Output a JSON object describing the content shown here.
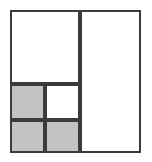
{
  "figure": {
    "name": "rectangle-subdivision-diagram",
    "type": "geometric-dissection",
    "background_color": "#ffffff",
    "stroke_color": "#3b3b3b",
    "stroke_width_px": 2,
    "shaded_fill_color": "#c3c3c3",
    "unshaded_fill_color": "#ffffff",
    "outer_bounds": {
      "x": 10,
      "y": 10,
      "width": 131,
      "height": 143
    },
    "cell_count": 6,
    "shaded_count": 3,
    "unshaded_count": 3,
    "cells": [
      {
        "id": "cell-top-left",
        "label": "top-left-large-white",
        "x": 10,
        "y": 10,
        "width": 70,
        "height": 74,
        "fill": "#ffffff",
        "shaded": false
      },
      {
        "id": "cell-right-tall",
        "label": "right-tall-white",
        "x": 80,
        "y": 10,
        "width": 61,
        "height": 143,
        "fill": "#ffffff",
        "shaded": false
      },
      {
        "id": "cell-mid-left",
        "label": "middle-left-gray",
        "x": 10,
        "y": 84,
        "width": 35,
        "height": 36,
        "fill": "#c3c3c3",
        "shaded": true
      },
      {
        "id": "cell-mid-right",
        "label": "middle-right-white",
        "x": 45,
        "y": 84,
        "width": 35,
        "height": 36,
        "fill": "#ffffff",
        "shaded": false
      },
      {
        "id": "cell-bottom-left",
        "label": "bottom-left-gray",
        "x": 10,
        "y": 120,
        "width": 35,
        "height": 33,
        "fill": "#c3c3c3",
        "shaded": true
      },
      {
        "id": "cell-bottom-right",
        "label": "bottom-right-gray",
        "x": 45,
        "y": 120,
        "width": 35,
        "height": 33,
        "fill": "#c3c3c3",
        "shaded": true
      }
    ]
  }
}
